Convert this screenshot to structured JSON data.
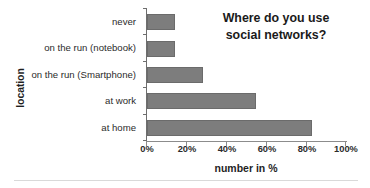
{
  "chart_data": {
    "type": "bar",
    "orientation": "horizontal",
    "title": "Where do you use social networks?",
    "title_lines": [
      "Where do you use",
      "social networks?"
    ],
    "xlabel": "number in %",
    "ylabel": "location",
    "categories": [
      "at home",
      "at work",
      "on the run (Smartphone)",
      "on the run (notebook)",
      "never"
    ],
    "values": [
      83,
      55,
      28,
      14,
      14
    ],
    "display_order_top_to_bottom": [
      "never",
      "on the run (notebook)",
      "on the run (Smartphone)",
      "at work",
      "at home"
    ],
    "values_top_to_bottom": [
      14,
      14,
      28,
      55,
      83
    ],
    "xlim": [
      0,
      100
    ],
    "xticks": [
      0,
      20,
      40,
      60,
      80,
      100
    ],
    "xtick_labels": [
      "0%",
      "20%",
      "40%",
      "60%",
      "80%",
      "100%"
    ],
    "grid": false,
    "legend": false,
    "bar_color": "#7d7d7d",
    "bar_edge_color": "#6b6b6b",
    "axis_color": "#8c8c8c",
    "text_color": "#262626"
  }
}
